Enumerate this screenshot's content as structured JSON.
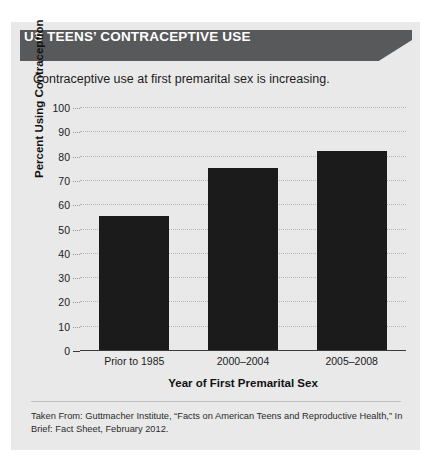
{
  "panel": {
    "header_title": "US TEENS’ CONTRACEPTIVE USE",
    "subtitle": "Contraceptive use at first premarital sex is increasing.",
    "source_note": "Taken From: Guttmacher Institute, “Facts on American Teens and Reproductive Health,” In Brief: Fact Sheet, February 2012.",
    "header_bg": "#58595b",
    "panel_bg": "#e9e9e9",
    "bar_color": "#1b1b1b"
  },
  "chart_data": {
    "type": "bar",
    "title": "US TEENS’ CONTRACEPTIVE USE",
    "subtitle": "Contraceptive use at first premarital sex is increasing.",
    "categories": [
      "Prior to 1985",
      "2000–2004",
      "2005–2008"
    ],
    "values": [
      55,
      75,
      82
    ],
    "xlabel": "Year of First Premarital Sex",
    "ylabel": "Percent Using Contraception",
    "ylim": [
      0,
      100
    ],
    "ytick_step": 10,
    "yticks": [
      100,
      90,
      80,
      70,
      60,
      50,
      40,
      30,
      20,
      10,
      0
    ],
    "ytick_labels": [
      "100",
      "90",
      "80",
      "70",
      "60",
      "50",
      "40",
      "30",
      "20",
      "10",
      "0"
    ],
    "grid": true,
    "legend": false,
    "series": [
      {
        "name": "Percent Using Contraception",
        "values": [
          55,
          75,
          82
        ]
      }
    ]
  }
}
